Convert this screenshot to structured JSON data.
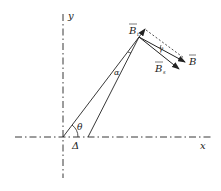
{
  "diagram": {
    "axes": {
      "x_label": "x",
      "y_label": "y"
    },
    "labels": {
      "theta": "θ",
      "delta": "Δ",
      "alpha": "α",
      "gamma": "γ",
      "B": "B",
      "Bt": "B",
      "Bt_sub": "t",
      "Bs": "B",
      "Bs_sub": "s"
    },
    "colors": {
      "stroke": "#222222",
      "background": "#ffffff"
    }
  }
}
